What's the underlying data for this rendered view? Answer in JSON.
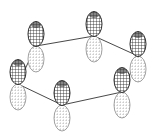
{
  "diagram": {
    "type": "p-orbital-hexagonal-ring",
    "colors": {
      "top_lobe": "#2a2a2a",
      "bottom_lobe": "#8a8a8a",
      "bond": "#333333"
    },
    "nodes": [
      {
        "id": "A",
        "x": 36,
        "y": 46
      },
      {
        "id": "B",
        "x": 94,
        "y": 36
      },
      {
        "id": "C",
        "x": 138,
        "y": 56
      },
      {
        "id": "F",
        "x": 122,
        "y": 92
      },
      {
        "id": "E",
        "x": 62,
        "y": 105
      },
      {
        "id": "D",
        "x": 18,
        "y": 84
      }
    ]
  }
}
